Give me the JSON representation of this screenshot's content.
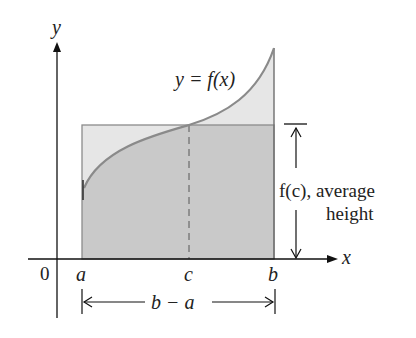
{
  "figure": {
    "colors": {
      "axis": "#111111",
      "curve": "#8a8a8a",
      "rect_fill": "#c9c9c9",
      "above_fill": "#e6e6e6",
      "rect_stroke": "#8c8c8c",
      "dashed": "#6a6a6a",
      "text": "#222222"
    },
    "labels": {
      "y_axis": "y",
      "x_axis": "x",
      "origin": "0",
      "a": "a",
      "c": "c",
      "b": "b",
      "curve": "y = f(x)",
      "fc": "f(c), average",
      "height": "height",
      "width": "b − a"
    }
  }
}
